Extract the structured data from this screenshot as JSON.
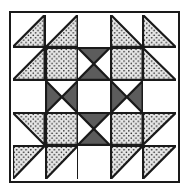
{
  "artwork": {
    "title": "Quilt Block Pattern",
    "type": "pieced-quilt-block",
    "grid": {
      "rows": 5,
      "columns": 5
    },
    "colors": {
      "background": "#ffffff",
      "outline": "#1a1a1a",
      "dotted_fill": "#e8e8e8",
      "dot_color": "#111111",
      "dark_gray": "#5c5c5c",
      "page_background": "#ffffff"
    },
    "border": {
      "style": "solid",
      "width_px": 2,
      "color": "#1a1a1a"
    },
    "grid_lines": {
      "style": "solid",
      "width_px": 1.5,
      "color": "#1a1a1a"
    },
    "legend": {
      "dotted": "dotted (printed) fabric patch",
      "dark": "dark solid fabric patch",
      "white": "plain white background patch"
    },
    "cells": [
      {
        "row": 1,
        "col": 1,
        "name": "cell-r1c1",
        "shapes": [
          {
            "fill": "dotted",
            "points": "0,100 100,0 100,100"
          }
        ]
      },
      {
        "row": 1,
        "col": 2,
        "name": "cell-r1c2",
        "shapes": [
          {
            "fill": "dotted",
            "points": "0,100 100,0 100,100"
          }
        ]
      },
      {
        "row": 1,
        "col": 3,
        "name": "cell-r1c3",
        "shapes": []
      },
      {
        "row": 1,
        "col": 4,
        "name": "cell-r1c4",
        "shapes": [
          {
            "fill": "dotted",
            "points": "0,0 100,100 0,100"
          }
        ]
      },
      {
        "row": 1,
        "col": 5,
        "name": "cell-r1c5",
        "shapes": [
          {
            "fill": "dotted",
            "points": "0,0 100,100 0,100"
          }
        ]
      },
      {
        "row": 2,
        "col": 1,
        "name": "cell-r2c1",
        "shapes": [
          {
            "fill": "dotted",
            "points": "0,100 100,0 100,100"
          }
        ]
      },
      {
        "row": 2,
        "col": 2,
        "name": "cell-r2c2",
        "shapes": [
          {
            "fill": "dotted",
            "points": "0,0 100,0 100,100 0,100"
          }
        ]
      },
      {
        "row": 2,
        "col": 3,
        "name": "cell-r2c3",
        "shapes": [
          {
            "fill": "dark",
            "points": "0,0 100,0 50,50"
          },
          {
            "fill": "dark",
            "points": "0,100 100,100 50,50"
          }
        ]
      },
      {
        "row": 2,
        "col": 4,
        "name": "cell-r2c4",
        "shapes": [
          {
            "fill": "dotted",
            "points": "0,0 100,0 100,100 0,100"
          }
        ]
      },
      {
        "row": 2,
        "col": 5,
        "name": "cell-r2c5",
        "shapes": [
          {
            "fill": "dotted",
            "points": "0,0 100,100 0,100"
          }
        ]
      },
      {
        "row": 3,
        "col": 1,
        "name": "cell-r3c1",
        "shapes": []
      },
      {
        "row": 3,
        "col": 2,
        "name": "cell-r3c2",
        "shapes": [
          {
            "fill": "dark",
            "points": "0,0 0,100 50,50"
          },
          {
            "fill": "dark",
            "points": "100,0 100,100 50,50"
          }
        ]
      },
      {
        "row": 3,
        "col": 3,
        "name": "cell-r3c3",
        "shapes": []
      },
      {
        "row": 3,
        "col": 4,
        "name": "cell-r3c4",
        "shapes": [
          {
            "fill": "dark",
            "points": "0,0 0,100 50,50"
          },
          {
            "fill": "dark",
            "points": "100,0 100,100 50,50"
          }
        ]
      },
      {
        "row": 3,
        "col": 5,
        "name": "cell-r3c5",
        "shapes": []
      },
      {
        "row": 4,
        "col": 1,
        "name": "cell-r4c1",
        "shapes": [
          {
            "fill": "dotted",
            "points": "0,0 100,0 100,100"
          }
        ]
      },
      {
        "row": 4,
        "col": 2,
        "name": "cell-r4c2",
        "shapes": [
          {
            "fill": "dotted",
            "points": "0,0 100,0 100,100 0,100"
          }
        ]
      },
      {
        "row": 4,
        "col": 3,
        "name": "cell-r4c3",
        "shapes": [
          {
            "fill": "dark",
            "points": "0,0 100,0 50,50"
          },
          {
            "fill": "dark",
            "points": "0,100 100,100 50,50"
          }
        ]
      },
      {
        "row": 4,
        "col": 4,
        "name": "cell-r4c4",
        "shapes": [
          {
            "fill": "dotted",
            "points": "0,0 100,0 100,100 0,100"
          }
        ]
      },
      {
        "row": 4,
        "col": 5,
        "name": "cell-r4c5",
        "shapes": [
          {
            "fill": "dotted",
            "points": "0,0 100,0 0,100"
          }
        ]
      },
      {
        "row": 5,
        "col": 1,
        "name": "cell-r5c1",
        "shapes": [
          {
            "fill": "dotted",
            "points": "0,0 100,0 0,100"
          }
        ]
      },
      {
        "row": 5,
        "col": 2,
        "name": "cell-r5c2",
        "shapes": [
          {
            "fill": "dotted",
            "points": "0,0 100,0 0,100"
          }
        ]
      },
      {
        "row": 5,
        "col": 3,
        "name": "cell-r5c3",
        "shapes": []
      },
      {
        "row": 5,
        "col": 4,
        "name": "cell-r5c4",
        "shapes": [
          {
            "fill": "dotted",
            "points": "0,0 100,0 0,100"
          }
        ]
      },
      {
        "row": 5,
        "col": 5,
        "name": "cell-r5c5",
        "shapes": [
          {
            "fill": "dotted",
            "points": "0,0 100,0 0,100"
          }
        ]
      }
    ]
  }
}
